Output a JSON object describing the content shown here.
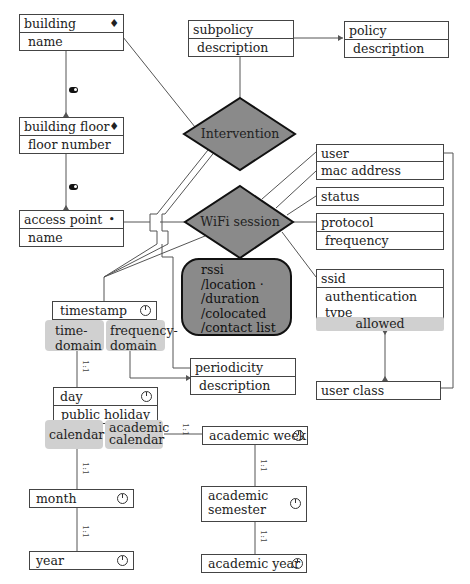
{
  "diagram": {
    "entities": {
      "building": {
        "name": "building",
        "attrs": [
          "name"
        ],
        "icon": "location-pin-icon"
      },
      "building_floor": {
        "name": "building floor",
        "attrs": [
          "floor number"
        ],
        "icon": "location-pin-icon"
      },
      "access_point": {
        "name": "access point",
        "attrs": [
          "name"
        ],
        "icon": "dot-icon"
      },
      "subpolicy": {
        "name": "subpolicy",
        "attrs": [
          "description"
        ]
      },
      "policy": {
        "name": "policy",
        "attrs": [
          "description"
        ]
      },
      "user": {
        "name": "user"
      },
      "mac_address": {
        "name": "mac address"
      },
      "status": {
        "name": "status"
      },
      "protocol": {
        "name": "protocol",
        "attrs": [
          "frequency"
        ]
      },
      "ssid": {
        "name": "ssid",
        "attrs": [
          "authentication type"
        ],
        "group": "allowed"
      },
      "user_class": {
        "name": "user class"
      },
      "timestamp": {
        "name": "timestamp",
        "icon": "clock-icon",
        "groups": [
          "time-domain",
          "frequency-domain"
        ]
      },
      "periodicity": {
        "name": "periodicity",
        "attrs": [
          "description"
        ]
      },
      "day": {
        "name": "day",
        "attrs": [
          "public holiday"
        ],
        "icon": "clock-icon",
        "groups": [
          "calendar",
          "academic calendar"
        ]
      },
      "month": {
        "name": "month",
        "icon": "clock-icon"
      },
      "year": {
        "name": "year",
        "icon": "clock-icon"
      },
      "academic_week": {
        "name": "academic week",
        "icon": "clock-icon"
      },
      "academic_semester": {
        "name": "academic semester",
        "icon": "clock-icon"
      },
      "academic_year": {
        "name": "academic year",
        "icon": "clock-icon"
      }
    },
    "relationships": {
      "intervention": "Intervention",
      "wifi_session": "WiFi session"
    },
    "derived_attributes": {
      "lines": [
        "rssi",
        "/location ·",
        "/duration",
        "/colocated",
        "/contact list"
      ]
    },
    "cardinality_label": "1:1",
    "colors": {
      "diamond_fill": "#8a8a8a",
      "group_fill": "#d0d0d0",
      "line": "#555555"
    }
  }
}
